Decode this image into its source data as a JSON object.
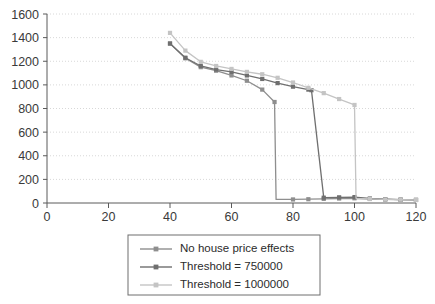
{
  "chart_data": {
    "type": "line",
    "title": "",
    "xlabel": "",
    "ylabel": "",
    "xlim": [
      0,
      120
    ],
    "ylim": [
      0,
      1600
    ],
    "xticks": [
      0,
      20,
      40,
      60,
      80,
      100,
      120
    ],
    "yticks": [
      0,
      200,
      400,
      600,
      800,
      1000,
      1200,
      1400,
      1600
    ],
    "grid": true,
    "grid_axis": "y",
    "legend_position": "bottom-center",
    "marker": "square",
    "series": [
      {
        "name": "No house price effects",
        "color": "#8e8e8e",
        "x": [
          40,
          45,
          50,
          55,
          60,
          65,
          70,
          74,
          74.5,
          80,
          85,
          90,
          95,
          100,
          105,
          110,
          115,
          120
        ],
        "y": [
          1350,
          1225,
          1150,
          1120,
          1080,
          1035,
          960,
          855,
          30,
          30,
          32,
          35,
          38,
          40,
          34,
          30,
          28,
          26
        ]
      },
      {
        "name": "Threshold = 750000",
        "color": "#6f6f6f",
        "x": [
          40,
          45,
          50,
          55,
          60,
          65,
          70,
          75,
          80,
          85,
          86,
          90,
          95,
          100,
          105,
          110,
          115,
          120
        ],
        "y": [
          1350,
          1230,
          1160,
          1130,
          1110,
          1080,
          1050,
          1015,
          985,
          960,
          955,
          45,
          48,
          50,
          38,
          32,
          28,
          26
        ]
      },
      {
        "name": "Threshold = 1000000",
        "color": "#c4c4c4",
        "x": [
          40,
          45,
          50,
          55,
          60,
          65,
          70,
          75,
          80,
          85,
          90,
          95,
          100,
          100.5,
          105,
          110,
          115,
          120
        ],
        "y": [
          1440,
          1290,
          1195,
          1160,
          1135,
          1110,
          1090,
          1060,
          1020,
          975,
          930,
          880,
          830,
          40,
          35,
          30,
          28,
          26
        ]
      }
    ]
  },
  "legend": {
    "entries": [
      {
        "label": "No house price effects"
      },
      {
        "label": "Threshold = 750000"
      },
      {
        "label": "Threshold = 1000000"
      }
    ]
  }
}
